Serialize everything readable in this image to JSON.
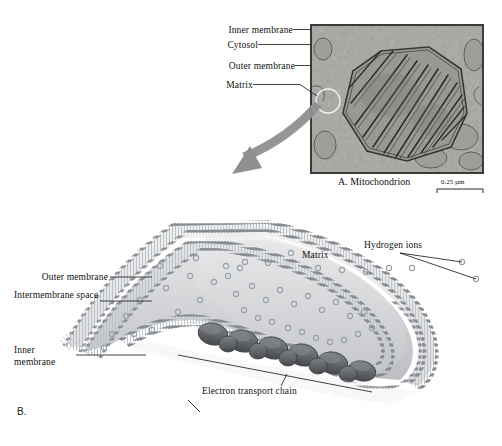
{
  "figure": {
    "panel_a_letter": "A.",
    "panel_b_letter": "B."
  },
  "panel_a": {
    "caption": "A. Mitochondrion",
    "image_kind": "electron-micrograph",
    "scale_bar": {
      "value": "0.25 µm",
      "length_px": 46
    },
    "labels": [
      {
        "id": "inner-membrane",
        "text": "Inner membrane",
        "x": 222,
        "y": 25,
        "leader": true
      },
      {
        "id": "cytosol",
        "text": "Cytosol",
        "x": 222,
        "y": 40,
        "leader": true
      },
      {
        "id": "outer-membrane",
        "text": "Outer membrane",
        "x": 222,
        "y": 61,
        "leader": true
      },
      {
        "id": "matrix",
        "text": "Matrix",
        "x": 222,
        "y": 80,
        "leader": true
      }
    ],
    "callout_circle": {
      "cx": 327,
      "cy": 100,
      "r": 12
    },
    "zoom_arrow": {
      "from": "callout-circle",
      "to": "panel-b",
      "color": "#8f8f8f"
    }
  },
  "panel_b": {
    "labels": [
      {
        "id": "outer-membrane",
        "text": "Outer membrane",
        "x": 18,
        "y": 272
      },
      {
        "id": "intermembrane-space",
        "text": "Intermembrane space",
        "x": 18,
        "y": 296
      },
      {
        "id": "inner-membrane",
        "text": "Inner membrane",
        "x": 18,
        "y": 350
      },
      {
        "id": "matrix",
        "text": "Matrix",
        "x": 303,
        "y": 253
      },
      {
        "id": "hydrogen-ions",
        "text": "Hydrogen ions",
        "x": 365,
        "y": 242
      },
      {
        "id": "electron-transport-chain",
        "text": "Electron transport chain",
        "x": 203,
        "y": 388
      }
    ]
  },
  "colors": {
    "ink": "#111111",
    "membrane_head": "#8d9096",
    "membrane_head_dark": "#6e7279",
    "membrane_tail": "#d8dade",
    "matrix_fill": "#d2d4d7",
    "intermembrane_fill": "#e8e9ea",
    "etc_complex": "#6a6c70",
    "etc_complex_dark": "#4f5154",
    "arrow_gray": "#8f8f8f",
    "micrograph_bg": "#9a9a94",
    "ion_stroke": "#9aa0a6"
  }
}
